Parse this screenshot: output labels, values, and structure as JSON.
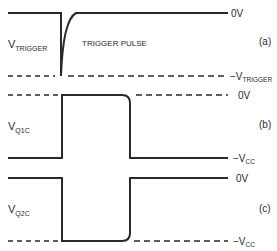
{
  "panels": [
    {
      "id": "a",
      "tag": "(a)",
      "signal_label_main": "V",
      "signal_label_sub": "TRIGGER",
      "annotation": "TRIGGER PULSE",
      "top_level_label": "0V",
      "bottom_level_label_main": "−V",
      "bottom_level_label_sub": "TRIGGER",
      "top_line_style": "solid",
      "bottom_line_style": "dashed"
    },
    {
      "id": "b",
      "tag": "(b)",
      "signal_label_main": "V",
      "signal_label_sub": "Q1C",
      "top_level_label": "0V",
      "bottom_level_label_main": "−V",
      "bottom_level_label_sub": "CC",
      "top_line_style": "dashed",
      "bottom_line_style": "solid"
    },
    {
      "id": "c",
      "tag": "(c)",
      "signal_label_main": "V",
      "signal_label_sub": "Q2C",
      "top_level_label": "0V",
      "bottom_level_label_main": "−V",
      "bottom_level_label_sub": "CC",
      "top_line_style": "solid",
      "bottom_line_style": "dashed"
    }
  ],
  "colors": {
    "ink": "#2a2a2a",
    "background": "#ffffff"
  }
}
